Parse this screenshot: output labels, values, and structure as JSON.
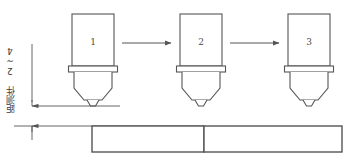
{
  "diagram": {
    "background_color": "#ffffff",
    "line_color": "#555555",
    "text_color": "#3a3a3a",
    "annotation": {
      "label": "距测件 2~4",
      "orientation": "vertical",
      "meaning_numbers": "2~4"
    },
    "stations": [
      {
        "id": "station-1",
        "number": "1",
        "x": 72,
        "y": 14,
        "width": 42,
        "height": 52
      },
      {
        "id": "station-2",
        "number": "2",
        "x": 180,
        "y": 14,
        "width": 42,
        "height": 52
      },
      {
        "id": "station-3",
        "number": "3",
        "x": 288,
        "y": 14,
        "width": 42,
        "height": 52
      }
    ],
    "arrows": [
      {
        "id": "arrow-1-to-2",
        "x1": 122,
        "y1": 43,
        "x2": 172,
        "y2": 43
      },
      {
        "id": "arrow-2-to-3",
        "x1": 230,
        "y1": 43,
        "x2": 280,
        "y2": 43
      }
    ],
    "workpieces": [
      {
        "id": "workpiece-left",
        "x": 92,
        "y": 126,
        "width": 112,
        "height": 26
      },
      {
        "id": "workpiece-right",
        "x": 204,
        "y": 126,
        "width": 138,
        "height": 26
      }
    ],
    "dimension": {
      "id": "gap-dimension",
      "x": 32,
      "top_y": 106,
      "bottom_y": 126,
      "upper_extension_from_x": 32,
      "upper_extension_to_x": 120,
      "lower_extension_from_x": 14,
      "lower_extension_to_x": 204
    }
  }
}
